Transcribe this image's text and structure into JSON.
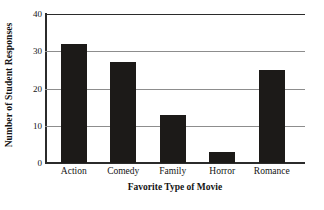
{
  "chart_data": {
    "type": "bar",
    "title": "",
    "xlabel": "Favorite Type of Movie",
    "ylabel": "Number of Student Responses",
    "categories": [
      "Action",
      "Comedy",
      "Family",
      "Horror",
      "Romance"
    ],
    "values": [
      32,
      27,
      13,
      3,
      25
    ],
    "ylim": [
      0,
      40
    ],
    "yticks": [
      0,
      10,
      20,
      30,
      40
    ],
    "ytick_labels": [
      "0",
      "10",
      "20",
      "30",
      "40"
    ],
    "grid": "horizontal",
    "legend": "none",
    "bar_color": "#1c1a18",
    "grid_color": "#8d8d8d",
    "axis_color": "#2b2b2b",
    "background": "#ffffff"
  }
}
